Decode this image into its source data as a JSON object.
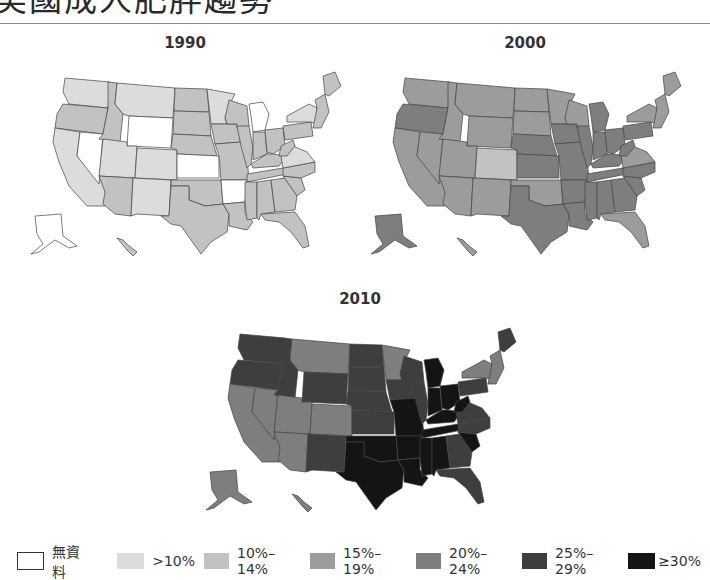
{
  "header": {
    "title": "美國成人肥胖趨勢"
  },
  "colors": {
    "none": "#ffffff",
    "lt10": "#dcdcdc",
    "c10_14": "#c2c2c2",
    "c15_19": "#9c9c9c",
    "c20_24": "#7e7e7e",
    "c25_29": "#3e3e3e",
    "ge30": "#141414"
  },
  "legend": {
    "items": [
      {
        "key": "none",
        "label": "無資料"
      },
      {
        "key": "lt10",
        "label": ">10%"
      },
      {
        "key": "c10_14",
        "label": "10%–14%"
      },
      {
        "key": "c15_19",
        "label": "15%–19%"
      },
      {
        "key": "c20_24",
        "label": "20%–24%"
      },
      {
        "key": "c25_29",
        "label": "25%–29%"
      },
      {
        "key": "ge30",
        "label": "≥30%"
      }
    ]
  },
  "chart_data": {
    "type": "choropleth",
    "title": "美國成人肥胖趨勢",
    "legend_position": "bottom",
    "categories": [
      "無資料",
      ">10%",
      "10%–14%",
      "15%–19%",
      "20%–24%",
      "25%–29%",
      "≥30%"
    ],
    "maps": [
      {
        "year": "1990",
        "states": {
          "WA": "lt10",
          "OR": "c10_14",
          "CA": "lt10",
          "NV": "none",
          "ID": "c10_14",
          "MT": "lt10",
          "WY": "none",
          "UT": "lt10",
          "CO": "lt10",
          "AZ": "c10_14",
          "NM": "lt10",
          "ND": "c10_14",
          "SD": "c10_14",
          "NE": "c10_14",
          "KS": "none",
          "OK": "c10_14",
          "TX": "c10_14",
          "MN": "lt10",
          "IA": "c10_14",
          "MO": "c10_14",
          "AR": "none",
          "LA": "c10_14",
          "WI": "c10_14",
          "IL": "c10_14",
          "MI": "none",
          "IN": "c10_14",
          "OH": "c10_14",
          "KY": "c10_14",
          "TN": "c10_14",
          "MS": "c10_14",
          "AL": "c10_14",
          "GA": "c10_14",
          "FL": "c10_14",
          "SC": "c10_14",
          "NC": "c10_14",
          "VA": "lt10",
          "WV": "c10_14",
          "PA": "c10_14",
          "NY": "lt10",
          "ME": "c10_14",
          "NE_states": "c10_14",
          "AK": "none",
          "HI": "c10_14"
        }
      },
      {
        "year": "2000",
        "states": {
          "WA": "c15_19",
          "OR": "c20_24",
          "CA": "c15_19",
          "NV": "c15_19",
          "ID": "c15_19",
          "MT": "c15_19",
          "WY": "c15_19",
          "UT": "c15_19",
          "CO": "c10_14",
          "AZ": "c15_19",
          "NM": "c15_19",
          "ND": "c15_19",
          "SD": "c15_19",
          "NE": "c20_24",
          "KS": "c20_24",
          "OK": "c15_19",
          "TX": "c20_24",
          "MN": "c15_19",
          "IA": "c20_24",
          "MO": "c20_24",
          "AR": "c20_24",
          "LA": "c20_24",
          "WI": "c15_19",
          "IL": "c20_24",
          "MI": "c20_24",
          "IN": "c20_24",
          "OH": "c20_24",
          "KY": "c20_24",
          "TN": "c20_24",
          "MS": "c20_24",
          "AL": "c20_24",
          "GA": "c20_24",
          "FL": "c15_19",
          "SC": "c20_24",
          "NC": "c20_24",
          "VA": "c15_19",
          "WV": "c20_24",
          "PA": "c20_24",
          "NY": "c15_19",
          "ME": "c15_19",
          "NE_states": "c15_19",
          "AK": "c20_24",
          "HI": "c15_19"
        }
      },
      {
        "year": "2010",
        "states": {
          "WA": "c25_29",
          "OR": "c25_29",
          "CA": "c20_24",
          "NV": "c20_24",
          "ID": "c25_29",
          "MT": "c20_24",
          "WY": "c25_29",
          "UT": "c20_24",
          "CO": "c20_24",
          "AZ": "c20_24",
          "NM": "c25_29",
          "ND": "c25_29",
          "SD": "c25_29",
          "NE": "c25_29",
          "KS": "c25_29",
          "OK": "ge30",
          "TX": "ge30",
          "MN": "c20_24",
          "IA": "c25_29",
          "MO": "ge30",
          "AR": "ge30",
          "LA": "ge30",
          "WI": "c25_29",
          "IL": "c25_29",
          "MI": "ge30",
          "IN": "ge30",
          "OH": "ge30",
          "KY": "ge30",
          "TN": "ge30",
          "MS": "ge30",
          "AL": "ge30",
          "GA": "c25_29",
          "FL": "c25_29",
          "SC": "ge30",
          "NC": "c25_29",
          "VA": "c25_29",
          "WV": "ge30",
          "PA": "c25_29",
          "NY": "c20_24",
          "ME": "c25_29",
          "NE_states": "c20_24",
          "AK": "c20_24",
          "HI": "c20_24"
        }
      }
    ]
  }
}
